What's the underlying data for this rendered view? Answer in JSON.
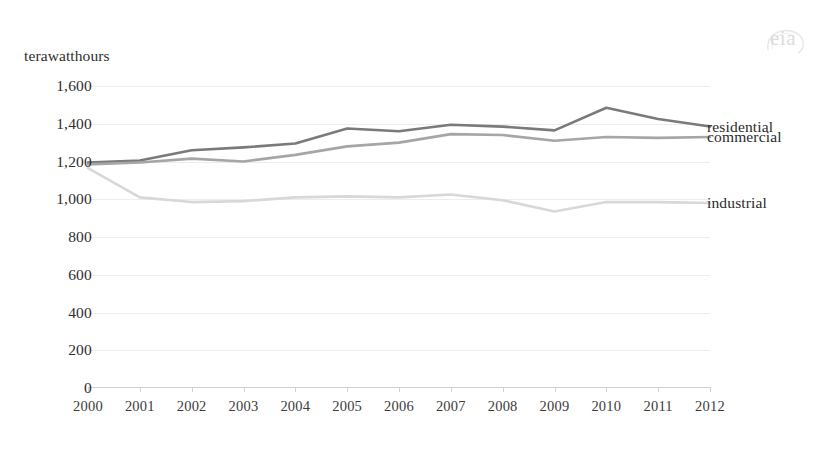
{
  "logo": {
    "text": "eia",
    "name": "eia-logo"
  },
  "chart_data": {
    "type": "line",
    "title": "",
    "subtitle": "",
    "unit_label": "terawatthours",
    "xlabel": "",
    "ylabel": "terawatthours",
    "x": [
      2000,
      2001,
      2002,
      2003,
      2004,
      2005,
      2006,
      2007,
      2008,
      2009,
      2010,
      2011,
      2012
    ],
    "xtick_labels": [
      "2000",
      "2001",
      "2002",
      "2003",
      "2004",
      "2005",
      "2006",
      "2007",
      "2008",
      "2009",
      "2010",
      "2011",
      "2012"
    ],
    "ytick_labels": [
      "0",
      "200",
      "400",
      "600",
      "800",
      "1,000",
      "1,200",
      "1,400",
      "1,600"
    ],
    "yticks": [
      0,
      200,
      400,
      600,
      800,
      1000,
      1200,
      1400,
      1600
    ],
    "ylim": [
      0,
      1600
    ],
    "xlim": [
      2000,
      2012
    ],
    "grid": true,
    "legend_position": "right-inline",
    "series": [
      {
        "name": "residential",
        "color": "#7a7a7a",
        "values": [
          1195,
          1205,
          1260,
          1275,
          1295,
          1375,
          1360,
          1395,
          1385,
          1365,
          1485,
          1425,
          1385
        ]
      },
      {
        "name": "commercial",
        "color": "#a6a6a6",
        "values": [
          1185,
          1195,
          1215,
          1200,
          1235,
          1280,
          1300,
          1345,
          1340,
          1310,
          1330,
          1325,
          1330
        ]
      },
      {
        "name": "industrial",
        "color": "#d8d8d8",
        "values": [
          1165,
          1010,
          985,
          990,
          1010,
          1015,
          1010,
          1025,
          995,
          935,
          985,
          985,
          980
        ]
      }
    ]
  }
}
